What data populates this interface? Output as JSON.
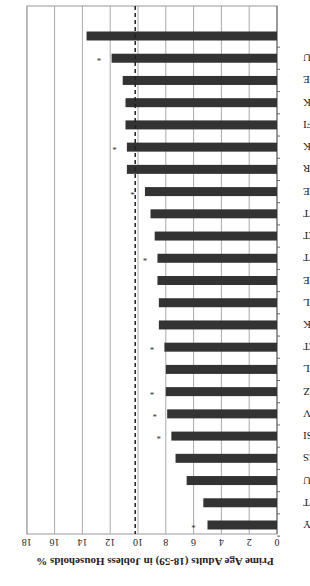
{
  "chart_data": {
    "type": "bar",
    "orientation": "rotated-180",
    "title": "",
    "ylabel": "Prime Age Adults (18-59) in Jobless Households %",
    "xlabel": "",
    "ylim": [
      0,
      18
    ],
    "yticks": [
      0,
      2,
      4,
      6,
      8,
      10,
      12,
      14,
      16,
      18
    ],
    "grid": true,
    "reference_line": {
      "value": 10.2,
      "style": "dashed"
    },
    "categories": [
      "CY",
      "PT",
      "LU",
      "ES",
      "SI",
      "LV",
      "CZ",
      "NL",
      "LT",
      "DK",
      "EL",
      "IE",
      "MT",
      "AT",
      "IT",
      "EE",
      "FR",
      "SK",
      "FI",
      "UK",
      "DE",
      "HU",
      ""
    ],
    "series": [
      {
        "name": "Bars",
        "values": [
          5.0,
          5.3,
          6.5,
          7.3,
          7.6,
          7.9,
          8.0,
          8.0,
          8.1,
          8.5,
          8.5,
          8.6,
          8.6,
          8.8,
          9.1,
          9.5,
          10.8,
          10.8,
          10.9,
          10.9,
          11.1,
          11.9,
          13.7
        ]
      },
      {
        "name": "Stars",
        "values": [
          6.0,
          null,
          null,
          null,
          8.5,
          8.8,
          9.0,
          null,
          9.0,
          null,
          null,
          null,
          9.5,
          null,
          null,
          10.4,
          null,
          11.7,
          null,
          null,
          null,
          12.8,
          null
        ]
      }
    ],
    "bar_color": "#333333"
  }
}
